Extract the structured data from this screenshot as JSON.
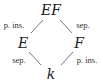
{
  "diagram": {
    "nodes": [
      {
        "id": "EF",
        "label": "EF",
        "x": 51,
        "y": 10
      },
      {
        "id": "E",
        "label": "E",
        "x": 23,
        "y": 43
      },
      {
        "id": "F",
        "label": "F",
        "x": 79,
        "y": 43
      },
      {
        "id": "k",
        "label": "k",
        "x": 51,
        "y": 74
      }
    ],
    "edges": [
      {
        "from": "EF",
        "to": "E",
        "label": "p. ins.",
        "x1": 43,
        "y1": 20,
        "x2": 31,
        "y2": 33,
        "lx": 14,
        "ly": 25
      },
      {
        "from": "EF",
        "to": "F",
        "label": "sep.",
        "x1": 60,
        "y1": 20,
        "x2": 72,
        "y2": 33,
        "lx": 83,
        "ly": 25
      },
      {
        "from": "E",
        "to": "k",
        "label": "sep.",
        "x1": 29,
        "y1": 52,
        "x2": 41,
        "y2": 65,
        "lx": 19,
        "ly": 60
      },
      {
        "from": "F",
        "to": "k",
        "label": "p. ins.",
        "x1": 73,
        "y1": 52,
        "x2": 61,
        "y2": 65,
        "lx": 87,
        "ly": 60
      }
    ]
  }
}
